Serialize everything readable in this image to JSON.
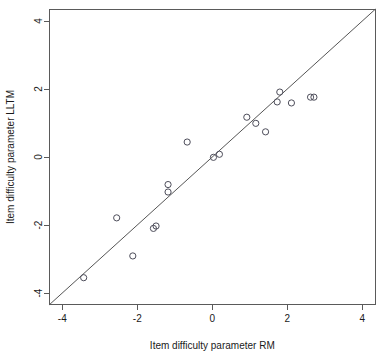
{
  "chart_data": {
    "type": "scatter",
    "title": "",
    "xlabel": "Item difficulty parameter RM",
    "ylabel": "Item difficulty parameter LLTM",
    "xlim": [
      -4.35,
      4.35
    ],
    "ylim": [
      -4.35,
      4.35
    ],
    "grid": false,
    "legend": null,
    "xticks": [
      -4,
      -2,
      0,
      2,
      4
    ],
    "yticks": [
      -4,
      -2,
      0,
      2,
      4
    ],
    "xtick_labels": [
      "-4",
      "-2",
      "0",
      "2",
      "4"
    ],
    "ytick_labels": [
      "-4",
      "-2",
      "0",
      "2",
      "4"
    ],
    "marker": "open-circle",
    "reference_line": {
      "name": "identity-line",
      "slope": 1,
      "intercept": 0,
      "from": [
        -4.35,
        -4.35
      ],
      "to": [
        4.35,
        4.35
      ]
    },
    "points": [
      {
        "x": -3.43,
        "y": -3.55
      },
      {
        "x": -2.55,
        "y": -1.79
      },
      {
        "x": -2.12,
        "y": -2.91
      },
      {
        "x": -1.57,
        "y": -2.1
      },
      {
        "x": -1.5,
        "y": -2.03
      },
      {
        "x": -1.18,
        "y": -0.81
      },
      {
        "x": -1.18,
        "y": -1.03
      },
      {
        "x": -0.67,
        "y": 0.44
      },
      {
        "x": 0.03,
        "y": -0.01
      },
      {
        "x": 0.19,
        "y": 0.08
      },
      {
        "x": 0.92,
        "y": 1.17
      },
      {
        "x": 1.16,
        "y": 0.99
      },
      {
        "x": 1.42,
        "y": 0.74
      },
      {
        "x": 1.73,
        "y": 1.62
      },
      {
        "x": 1.8,
        "y": 1.91
      },
      {
        "x": 2.11,
        "y": 1.59
      },
      {
        "x": 2.62,
        "y": 1.76
      },
      {
        "x": 2.71,
        "y": 1.76
      }
    ]
  },
  "axes": {
    "x_title": "Item difficulty parameter RM",
    "y_title": "Item difficulty parameter LLTM"
  },
  "colors": {
    "background": "#ffffff",
    "axis": "#5a5a5a",
    "point_stroke": "#4d4d5a",
    "line": "#555555",
    "text": "#1a1a1a"
  }
}
